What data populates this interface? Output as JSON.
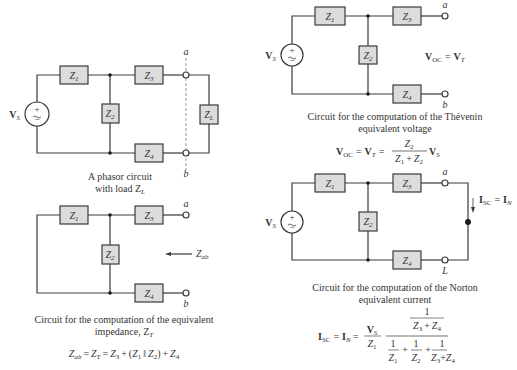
{
  "diagrams": {
    "phasor": {
      "source": "V",
      "source_sub": "S",
      "z1": "Z",
      "z1_sub": "1",
      "z2": "Z",
      "z2_sub": "2",
      "z3": "Z",
      "z3_sub": "3",
      "z4": "Z",
      "z4_sub": "4",
      "zl": "Z",
      "zl_sub": "L",
      "terminal_a": "a",
      "terminal_b": "b",
      "caption_line1": "A phasor circuit",
      "caption_line2": "with load Z",
      "caption_line2_sub": "L"
    },
    "impedance": {
      "z1": "Z",
      "z1_sub": "1",
      "z2": "Z",
      "z2_sub": "2",
      "z3": "Z",
      "z3_sub": "3",
      "z4": "Z",
      "z4_sub": "4",
      "terminal_a": "a",
      "terminal_b": "b",
      "arrow_label": "Z",
      "arrow_label_sub": "ab",
      "caption_line1": "Circuit for the computation of the equivalent",
      "caption_line2": "impedance, Z",
      "caption_line2_sub": "T",
      "formula": "Z_ab = Z_T = Z_3 + (Z_1 || Z_2) + Z_4"
    },
    "thevenin": {
      "source": "V",
      "source_sub": "S",
      "z1": "Z",
      "z1_sub": "1",
      "z2": "Z",
      "z2_sub": "2",
      "z3": "Z",
      "z3_sub": "3",
      "z4": "Z",
      "z4_sub": "4",
      "terminal_a": "a",
      "terminal_b": "b",
      "inline_label": "V_OC = V_T",
      "caption_line1": "Circuit for the computation of the Thévenin",
      "caption_line2": "equivalent voltage",
      "formula": "V_OC = V_T = Z_2 / (Z_1 + Z_2) V_S"
    },
    "norton": {
      "source": "V",
      "source_sub": "S",
      "z1": "Z",
      "z1_sub": "1",
      "z2": "Z",
      "z2_sub": "2",
      "z3": "Z",
      "z3_sub": "3",
      "z4": "Z",
      "z4_sub": "4",
      "terminal_a": "a",
      "terminal_b": "L",
      "current_label": "I_SC = I_N",
      "caption_line1": "Circuit for the computation of the Norton",
      "caption_line2": "equivalent current",
      "formula": "I_SC = I_N = (V_S / Z_1) * [1/(Z_3 + Z_4)] / [1/Z_1 + 1/Z_2 + 1/(Z_3 + Z_4)]"
    }
  },
  "formula_parts": {
    "z": "Z",
    "v": "V",
    "i": "I",
    "equals": "=",
    "plus": "+",
    "one": "1",
    "par": "‖",
    "lparen": "(",
    "rparen": ")",
    "oc": "OC",
    "sc": "SC",
    "t": "T",
    "n": "N",
    "s": "S",
    "ab": "ab",
    "s1": "1",
    "s2": "2",
    "s3": "3",
    "s4": "4"
  },
  "colors": {
    "wire": "#3a3a3a",
    "box_fill": "#dcdcdc",
    "text": "#333333"
  }
}
